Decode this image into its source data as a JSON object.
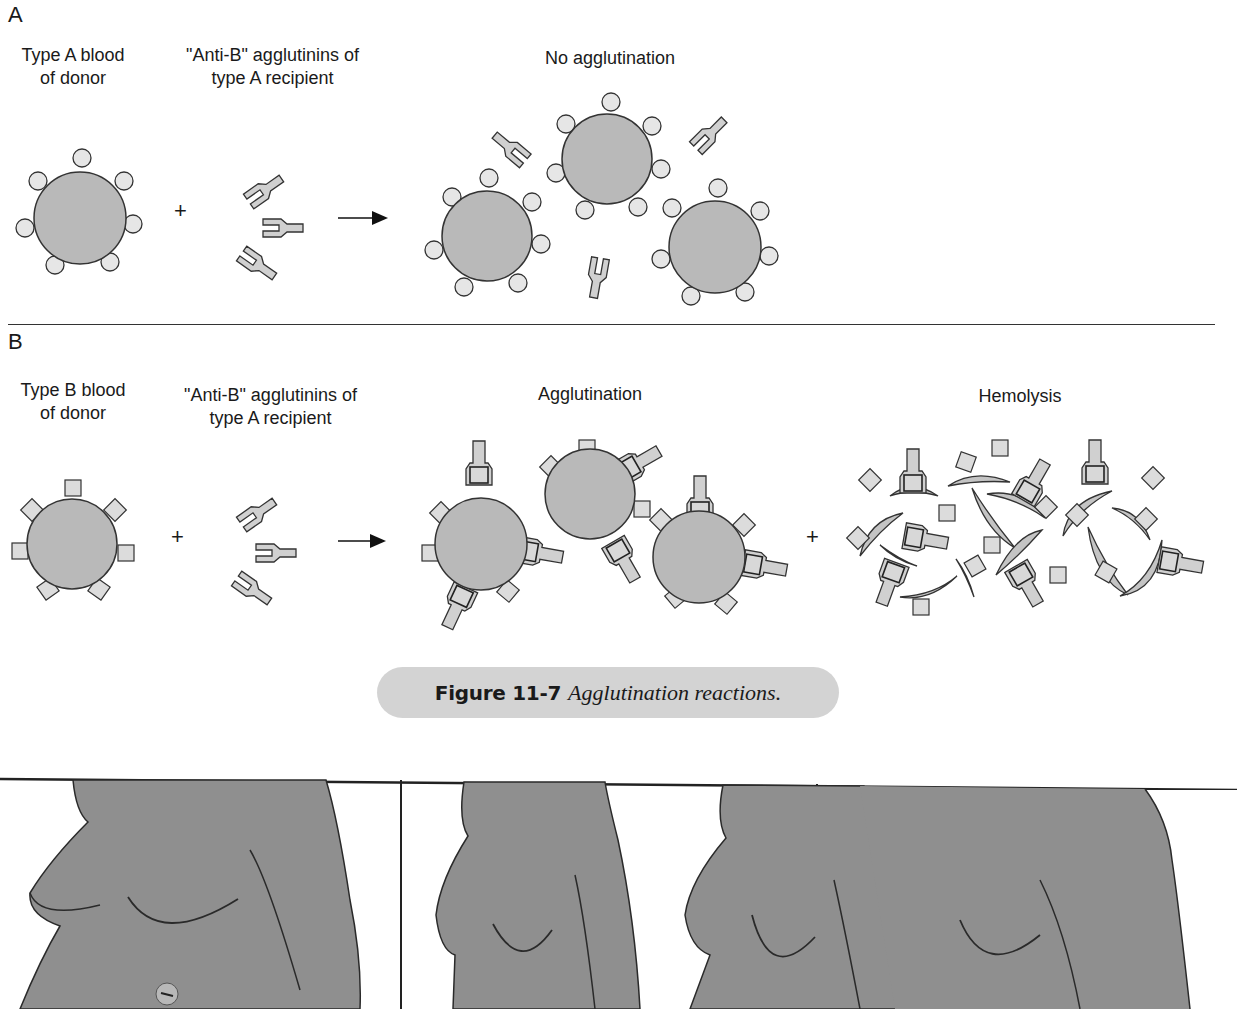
{
  "panel_a": {
    "letter": "A",
    "donor_label_line1": "Type A blood",
    "donor_label_line2": "of donor",
    "agglutinin_label_line1": "\"Anti-B\" agglutinins of",
    "agglutinin_label_line2": "type A recipient",
    "result_label": "No agglutination",
    "plus": "+"
  },
  "panel_b": {
    "letter": "B",
    "donor_label_line1": "Type B blood",
    "donor_label_line2": "of donor",
    "agglutinin_label_line1": "\"Anti-B\" agglutinins of",
    "agglutinin_label_line2": "type A recipient",
    "result_label": "Agglutination",
    "result2_label": "Hemolysis",
    "plus": "+",
    "plus2": "+"
  },
  "caption": {
    "figure_number": "Figure 11-7",
    "title": "Agglutination reactions."
  },
  "colors": {
    "cell_fill": "#b9b9b9",
    "antigen_fill": "#e6e6e6",
    "antibody_fill": "#d0d0d0",
    "caption_bg": "#d3d3d3",
    "torso_fill": "#8f8f8f"
  }
}
